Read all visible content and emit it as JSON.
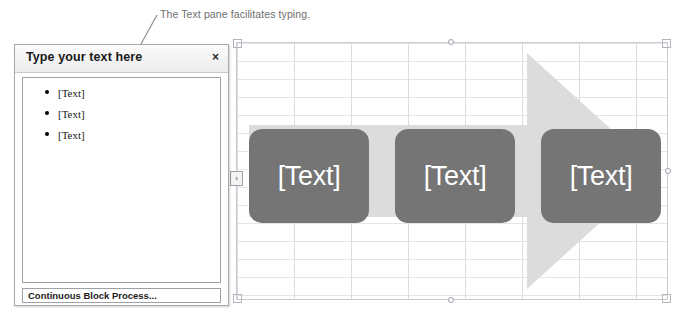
{
  "annotation": {
    "text": "The Text pane facilitates typing.",
    "leader_line_color": "#8a8a8a"
  },
  "text_pane": {
    "title": "Type your text here",
    "close_label": "×",
    "close_icon_name": "close-icon",
    "bullets": [
      {
        "label": "[Text]"
      },
      {
        "label": "[Text]"
      },
      {
        "label": "[Text]"
      }
    ],
    "status": "Continuous Block Process..."
  },
  "smartart": {
    "toggle_glyph": "›",
    "layout_name": "Continuous Block Process",
    "arrow_color": "#dcdcdc",
    "block_color": "#757575",
    "block_text_color": "#ffffff",
    "grid_line_color": "#dfe2e6",
    "blocks": [
      {
        "label": "[Text]"
      },
      {
        "label": "[Text]"
      },
      {
        "label": "[Text]"
      }
    ]
  }
}
